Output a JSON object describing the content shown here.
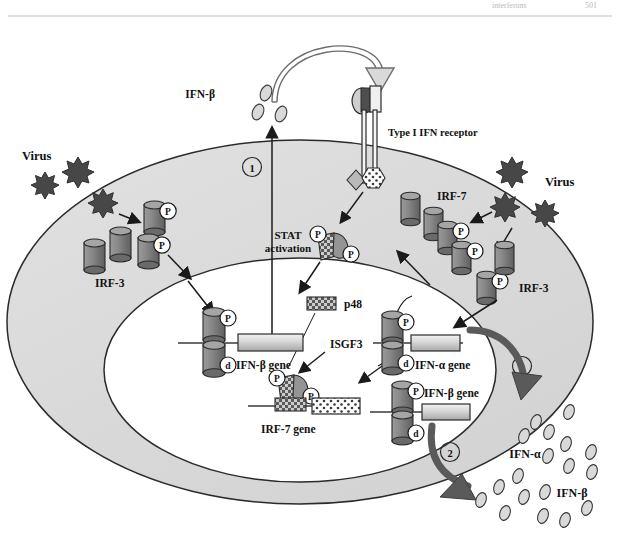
{
  "page": {
    "header_left": "interferons",
    "header_right": "501",
    "background_color": "#ffffff",
    "cytoplasm_color": "#dcdcdc",
    "nucleus_color": "#ffffff",
    "outline_color": "#2b2b2b",
    "protein_color": "#8c8c8c",
    "virus_color": "#474747",
    "arrow_color": "#555555"
  },
  "labels": {
    "virus_left": "Virus",
    "virus_right": "Virus",
    "irf3_left": "IRF-3",
    "irf3_right": "IRF-3",
    "irf7_right": "IRF-7",
    "ifn_beta_secreted": "IFN-β",
    "receptor": "Type I IFN receptor",
    "stat_activation_line1": "STAT",
    "stat_activation_line2": "activation",
    "p48": "p48",
    "isgf3": "ISGF3",
    "ifn_beta_gene_left": "IFN-β gene",
    "irf7_gene": "IRF-7 gene",
    "ifn_alpha_gene": "IFN-α gene",
    "ifn_beta_gene_right": "IFN-β gene",
    "ifn_alpha_output": "IFN-α",
    "ifn_beta_output": "IFN-β",
    "step_one": "1",
    "step_two_upper": "2",
    "step_two_lower": "2",
    "phospho": "P",
    "dimer": "d"
  },
  "diagram": {
    "type": "cell-signaling-pathway",
    "compartments": [
      {
        "name": "extracellular-space",
        "fill": "#ffffff"
      },
      {
        "name": "cytoplasm",
        "fill": "#dcdcdc"
      },
      {
        "name": "nucleus",
        "fill": "#ffffff"
      }
    ],
    "steps": [
      {
        "id": "1",
        "description": "IFN-β secretion after initial virus-induced IRF-3 activation"
      },
      {
        "id": "2",
        "description": "IRF-7 driven amplification producing IFN-α and IFN-β"
      }
    ],
    "molecules": [
      {
        "name": "IRF-3",
        "shape": "cylinder",
        "count_left": 4,
        "count_right": 2,
        "phosphorylated": true
      },
      {
        "name": "IRF-7",
        "shape": "cylinder",
        "count": 5,
        "phosphorylated": true
      },
      {
        "name": "p48",
        "shape": "checkered-rectangle"
      },
      {
        "name": "ISGF3",
        "shape": "stat-complex"
      },
      {
        "name": "Type I IFN receptor",
        "shape": "transmembrane-bars"
      }
    ],
    "genes": [
      {
        "name": "IFN-β gene",
        "location": "nucleus-left",
        "fill": "gradient"
      },
      {
        "name": "IRF-7 gene",
        "location": "nucleus-center",
        "fill": "dotted"
      },
      {
        "name": "IFN-α gene",
        "location": "nucleus-right",
        "fill": "gradient"
      },
      {
        "name": "IFN-β gene",
        "location": "nucleus-right-lower",
        "fill": "gradient"
      }
    ],
    "particle_counts": {
      "ifn_beta_top": 3,
      "ifn_alpha_output": 9,
      "ifn_beta_output": 9
    }
  }
}
